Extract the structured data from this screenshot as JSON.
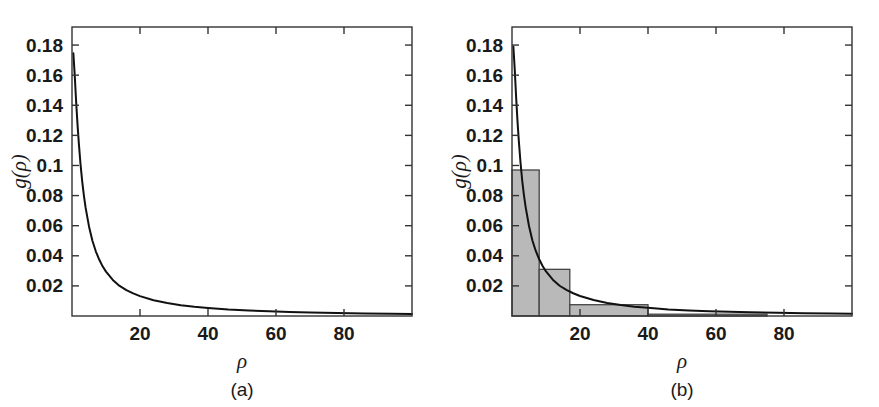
{
  "figure": {
    "background_color": "#ffffff",
    "ink_color": "#1a1a1a",
    "bar_fill_color": "#b9b9b9",
    "bar_edge_color": "#444444",
    "curve_color": "#111111"
  },
  "panels": [
    {
      "id": "a",
      "caption": "(a)",
      "xlabel": "ρ",
      "ylabel_g": "g",
      "ylabel_open": "(",
      "ylabel_rho": "ρ",
      "ylabel_close": ")",
      "ylabel": "g(ρ)",
      "xticks": [
        "20",
        "40",
        "60",
        "80"
      ],
      "yticks": [
        "0.02",
        "0.04",
        "0.06",
        "0.08",
        "0.1",
        "0.12",
        "0.14",
        "0.16",
        "0.18"
      ]
    },
    {
      "id": "b",
      "caption": "(b)",
      "xlabel": "ρ",
      "ylabel_g": "g",
      "ylabel_open": "(",
      "ylabel_rho": "ρ",
      "ylabel_close": ")",
      "ylabel": "g(ρ)",
      "xticks": [
        "20",
        "40",
        "60",
        "80"
      ],
      "yticks": [
        "0.02",
        "0.04",
        "0.06",
        "0.08",
        "0.1",
        "0.12",
        "0.14",
        "0.16",
        "0.18"
      ]
    }
  ],
  "chart_data": [
    {
      "type": "line",
      "panel": "a",
      "title": "",
      "xlabel": "ρ",
      "ylabel": "g(ρ)",
      "xlim": [
        0,
        100
      ],
      "ylim": [
        0,
        0.192
      ],
      "xticks": [
        20,
        40,
        60,
        80
      ],
      "yticks": [
        0.02,
        0.04,
        0.06,
        0.08,
        0.1,
        0.12,
        0.14,
        0.16,
        0.18
      ],
      "grid": false,
      "legend": "none",
      "series": [
        {
          "name": "g(ρ)",
          "x": [
            0.4,
            0.8,
            1.2,
            1.6,
            2,
            2.5,
            3,
            3.5,
            4,
            5,
            6,
            7,
            8,
            9,
            10,
            12,
            14,
            16,
            18,
            20,
            24,
            28,
            32,
            36,
            40,
            46,
            52,
            58,
            64,
            70,
            78,
            86,
            94,
            100
          ],
          "y": [
            0.1745,
            0.16,
            0.143,
            0.128,
            0.115,
            0.101,
            0.0895,
            0.08,
            0.072,
            0.0595,
            0.05,
            0.043,
            0.0375,
            0.033,
            0.0295,
            0.024,
            0.02,
            0.0172,
            0.015,
            0.0132,
            0.0105,
            0.0086,
            0.0072,
            0.0061,
            0.0053,
            0.0043,
            0.0036,
            0.0031,
            0.0027,
            0.0024,
            0.002,
            0.0017,
            0.0015,
            0.0014
          ]
        }
      ]
    },
    {
      "type": "bar",
      "panel": "b",
      "title": "",
      "xlabel": "ρ",
      "ylabel": "g(ρ)",
      "xlim": [
        0,
        100
      ],
      "ylim": [
        0,
        0.192
      ],
      "xticks": [
        20,
        40,
        60,
        80
      ],
      "yticks": [
        0.02,
        0.04,
        0.06,
        0.08,
        0.1,
        0.12,
        0.14,
        0.16,
        0.18
      ],
      "grid": false,
      "legend": "none",
      "bin_edges": [
        0,
        8,
        17,
        40,
        75
      ],
      "bin_heights": [
        0.097,
        0.031,
        0.0075,
        0.0012
      ],
      "overlay_series": [
        {
          "name": "g(ρ)",
          "x": [
            0.4,
            0.8,
            1.2,
            1.6,
            2,
            2.5,
            3,
            3.5,
            4,
            5,
            6,
            7,
            8,
            9,
            10,
            12,
            14,
            16,
            18,
            20,
            24,
            28,
            32,
            36,
            40,
            46,
            52,
            58,
            64,
            70,
            78,
            86,
            94,
            100
          ],
          "y": [
            0.179,
            0.164,
            0.146,
            0.13,
            0.1165,
            0.102,
            0.09,
            0.0805,
            0.0725,
            0.0598,
            0.0502,
            0.0432,
            0.0377,
            0.0332,
            0.0296,
            0.0241,
            0.0201,
            0.0173,
            0.0151,
            0.0133,
            0.0106,
            0.0087,
            0.0073,
            0.0062,
            0.0054,
            0.0044,
            0.0037,
            0.0032,
            0.0028,
            0.0025,
            0.0021,
            0.0018,
            0.0016,
            0.0015
          ]
        }
      ]
    }
  ]
}
